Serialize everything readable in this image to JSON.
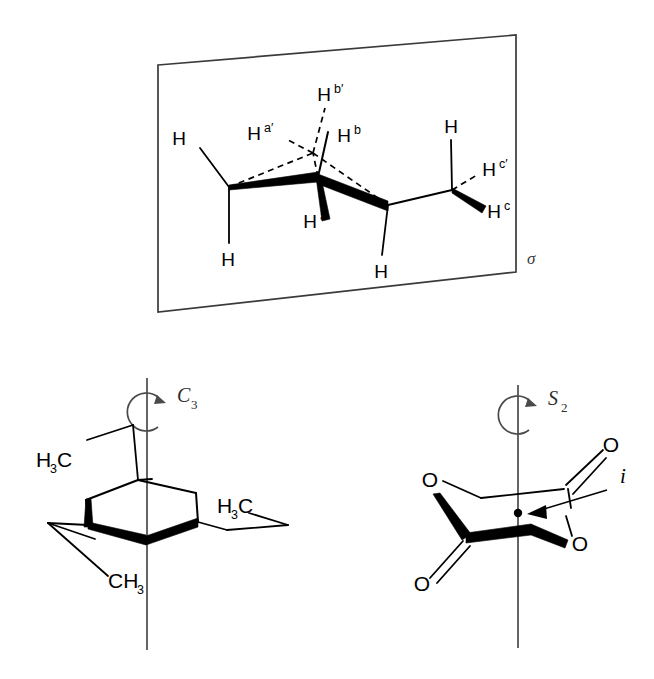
{
  "figure": {
    "panels": [
      {
        "id": "panel-sigma",
        "name": "mirror-plane-panel",
        "symmetry_label": "σ",
        "description": "n-butane in anti conformation lying in a mirror plane"
      },
      {
        "id": "panel-c3",
        "name": "c3-axis-panel",
        "symmetry_label": "C",
        "symmetry_sub": "3",
        "description": "1,3,5-trimethylcyclohexane chair with C3 rotation axis"
      },
      {
        "id": "panel-s2",
        "name": "s2-axis-panel",
        "symmetry_label": "S",
        "symmetry_sub": "2",
        "inversion_label": "i",
        "description": "Cyclic dilactone with S2 axis and inversion centre"
      }
    ]
  },
  "panel_sigma": {
    "plane_label": "σ",
    "hydrogen_labels": [
      {
        "id": "h-left-upper",
        "text": "H",
        "sup": ""
      },
      {
        "id": "h-left-lower",
        "text": "H",
        "sup": ""
      },
      {
        "id": "h-a-prime",
        "text": "H",
        "sup": "a′"
      },
      {
        "id": "h-b-prime",
        "text": "H",
        "sup": "b′"
      },
      {
        "id": "h-b",
        "text": "H",
        "sup": "b"
      },
      {
        "id": "h-a",
        "text": "H",
        "sup": "a"
      },
      {
        "id": "h-mid-lower",
        "text": "H",
        "sup": ""
      },
      {
        "id": "h-right-upper",
        "text": "H",
        "sup": ""
      },
      {
        "id": "h-c-prime",
        "text": "H",
        "sup": "c′"
      },
      {
        "id": "h-c",
        "text": "H",
        "sup": "c"
      }
    ]
  },
  "panel_c3": {
    "axis_label_main": "C",
    "axis_label_sub": "3",
    "methyl_labels": [
      {
        "id": "methyl-upper-left",
        "text": "H",
        "sub": "3",
        "tail": "C"
      },
      {
        "id": "methyl-right",
        "text": "H",
        "sub": "3",
        "tail": "C"
      },
      {
        "id": "methyl-bottom",
        "text": "CH",
        "sub": "3",
        "tail": ""
      }
    ]
  },
  "panel_s2": {
    "axis_label_main": "S",
    "axis_label_sub": "2",
    "inversion_label": "i",
    "oxygen_labels": [
      {
        "id": "o-upper-right-carbonyl",
        "text": "O"
      },
      {
        "id": "o-upper-left-ester",
        "text": "O"
      },
      {
        "id": "o-lower-right-ester",
        "text": "O"
      },
      {
        "id": "o-lower-left-carbonyl",
        "text": "O"
      }
    ]
  },
  "colors": {
    "ink": "#000000",
    "plane_stroke": "#3a3a3a",
    "axis_stroke": "#4a4a4a",
    "background": "#ffffff"
  }
}
